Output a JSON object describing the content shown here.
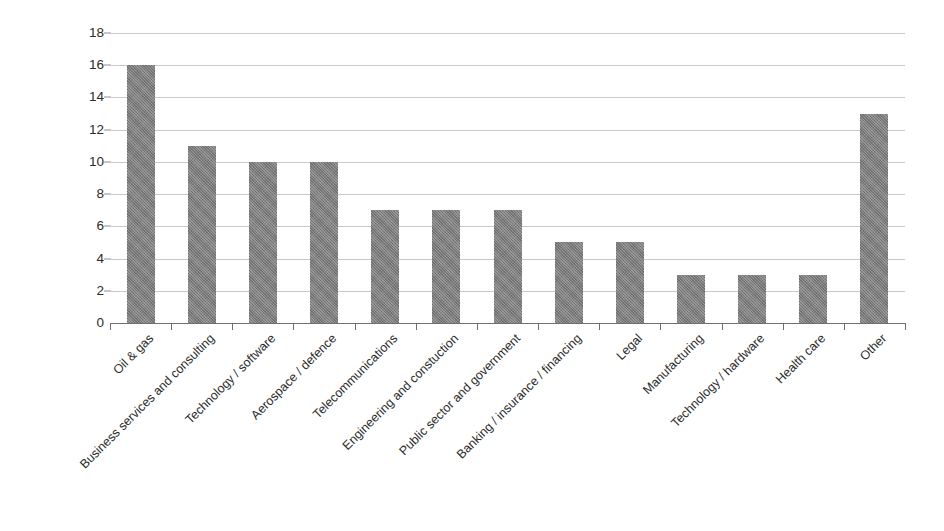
{
  "chart_data": {
    "type": "bar",
    "title": "",
    "subtitle": "",
    "xlabel": "",
    "ylabel": "",
    "categories": [
      "Oil & gas",
      "Business services and consulting",
      "Technology / software",
      "Aerospace / defence",
      "Telecommunications",
      "Engineering and constuction",
      "Public sector and government",
      "Banking / insurance / financing",
      "Legal",
      "Manufacturing",
      "Technology / hardware",
      "Health care",
      "Other"
    ],
    "values": [
      16,
      11,
      10,
      10,
      7,
      7,
      7,
      5,
      5,
      3,
      3,
      3,
      13
    ],
    "ylim": [
      0,
      18
    ],
    "ytick_values": [
      0,
      2,
      4,
      6,
      8,
      10,
      12,
      14,
      16,
      18
    ],
    "ytick_labels": [
      "0",
      "2",
      "4",
      "6",
      "8",
      "10",
      "12",
      "14",
      "16",
      "18"
    ],
    "grid": true,
    "grid_axis": "y",
    "legend": false,
    "legend_position": "none",
    "bar_color": "#7c7c7c",
    "grid_color": "#c9c9c9",
    "axis_color": "#6f6f6f",
    "text_color": "#2b2b2b",
    "background_color": "#ffffff",
    "xtick_label_rotation": -45
  }
}
